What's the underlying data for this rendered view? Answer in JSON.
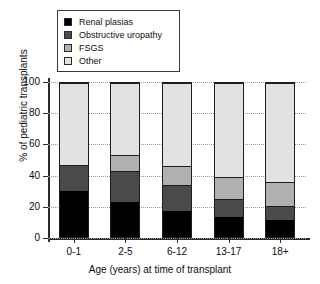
{
  "chart_data": {
    "type": "bar",
    "stacked": true,
    "title": "",
    "xlabel": "Age (years) at time of transplant",
    "ylabel": "% of pediatric transplants",
    "ylim": [
      0,
      100
    ],
    "yticks": [
      0,
      20,
      40,
      60,
      80,
      100
    ],
    "grid": true,
    "legend_position": "top-left",
    "categories": [
      "0-1",
      "2-5",
      "6-12",
      "13-17",
      "18+"
    ],
    "series": [
      {
        "name": "Renal plasias",
        "color": "#000000",
        "values": [
          30,
          23,
          17,
          13,
          11
        ]
      },
      {
        "name": "Obstructive uropathy",
        "color": "#4a4a4a",
        "values": [
          17,
          20,
          17,
          12,
          9
        ]
      },
      {
        "name": "FSGS",
        "color": "#b0b0b0",
        "values": [
          0,
          10,
          12,
          14,
          16
        ]
      },
      {
        "name": "Other",
        "color": "#e2e2e2",
        "values": [
          53,
          47,
          54,
          61,
          64
        ]
      }
    ]
  },
  "legend": {
    "items": [
      {
        "label": "Renal plasias",
        "color": "#000000"
      },
      {
        "label": "Obstructive uropathy",
        "color": "#4a4a4a"
      },
      {
        "label": "FSGS",
        "color": "#b0b0b0"
      },
      {
        "label": "Other",
        "color": "#e2e2e2"
      }
    ]
  },
  "axes": {
    "y_title": "% of pediatric transplants",
    "x_title": "Age (years) at time of transplant",
    "y_tick_labels": [
      "100",
      "80",
      "60",
      "40",
      "20",
      "0"
    ],
    "x_tick_labels": [
      "0-1",
      "2-5",
      "6-12",
      "13-17",
      "18+"
    ]
  }
}
